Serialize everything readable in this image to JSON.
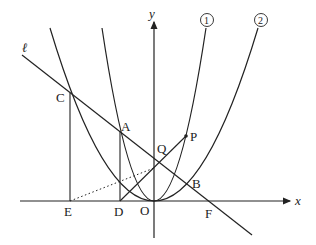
{
  "diagram": {
    "axes": {
      "x_label": "x",
      "y_label": "y",
      "origin_label": "O"
    },
    "curves": [
      {
        "id": "curve-1",
        "label": "①",
        "description": "steeper parabola through O"
      },
      {
        "id": "curve-2",
        "label": "②",
        "description": "wider parabola through O"
      }
    ],
    "line": {
      "label": "ℓ"
    },
    "points": {
      "A": "A",
      "B": "B",
      "C": "C",
      "D": "D",
      "E": "E",
      "F": "F",
      "P": "P",
      "Q": "Q",
      "O": "O"
    },
    "colors": {
      "stroke": "#222222",
      "background": "#ffffff"
    }
  }
}
